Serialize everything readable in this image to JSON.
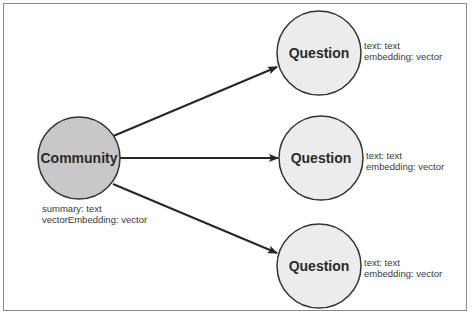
{
  "diagram": {
    "colors": {
      "frame_border": "#8a8a8a",
      "community_fill": "#c8c8c8",
      "question_fill": "#ececec",
      "node_stroke": "#333333",
      "edge": "#262626",
      "label_text": "#2b2b2b",
      "property_text": "#3a3a3a"
    },
    "source_node": {
      "label": "Community",
      "properties": [
        "summary: text",
        "vectorEmbedding: vector"
      ]
    },
    "target_nodes": [
      {
        "label": "Question",
        "properties": [
          "text: text",
          "embedding: vector"
        ]
      },
      {
        "label": "Question",
        "properties": [
          "text: text",
          "embedding: vector"
        ]
      },
      {
        "label": "Question",
        "properties": [
          "text: text",
          "embedding: vector"
        ]
      }
    ],
    "edges": [
      {
        "from": "Community",
        "to": "Question (top)",
        "directed": true
      },
      {
        "from": "Community",
        "to": "Question (middle)",
        "directed": true
      },
      {
        "from": "Community",
        "to": "Question (bottom)",
        "directed": true
      }
    ]
  }
}
